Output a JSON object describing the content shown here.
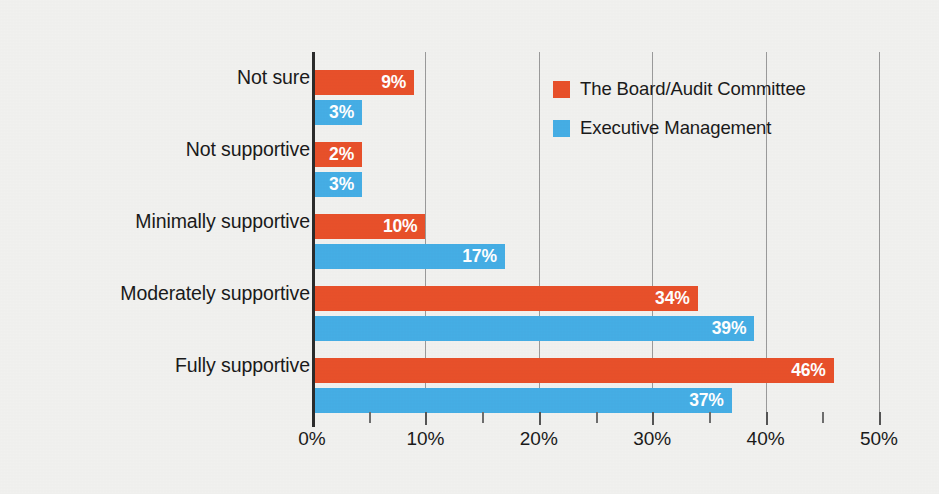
{
  "chart_data": {
    "type": "bar",
    "orientation": "horizontal",
    "title": "",
    "xlabel": "",
    "ylabel": "",
    "xlim": [
      0,
      50
    ],
    "grid": true,
    "grid_axis": "x",
    "legend_position": "top-right",
    "categories": [
      "Not sure",
      "Not supportive",
      "Minimally supportive",
      "Moderately supportive",
      "Fully supportive"
    ],
    "tick_labels": [
      "0%",
      "10%",
      "20%",
      "30%",
      "40%",
      "50%"
    ],
    "tick_values": [
      0,
      10,
      20,
      30,
      40,
      50
    ],
    "minor_tick_values": [
      5,
      15,
      25,
      35,
      45
    ],
    "series": [
      {
        "name": "The Board/Audit Committee",
        "color": "#e8502a",
        "values": [
          9,
          2,
          10,
          34,
          46
        ],
        "labels": [
          "9%",
          "2%",
          "10%",
          "34%",
          "46%"
        ]
      },
      {
        "name": "Executive Management",
        "color": "#45aee5",
        "values": [
          3,
          3,
          17,
          39,
          37
        ],
        "labels": [
          "3%",
          "3%",
          "17%",
          "39%",
          "37%"
        ]
      }
    ]
  },
  "legend": {
    "items": [
      {
        "label": "The Board/Audit Committee",
        "color": "#e8502a"
      },
      {
        "label": "Executive Management",
        "color": "#45aee5"
      }
    ]
  },
  "colors": {
    "background": "#f1f1ef",
    "orange": "#e8502a",
    "blue": "#45aee5",
    "axis": "#2b2b2b",
    "grid": "#9a9a9a",
    "text": "#1a1a1a"
  }
}
